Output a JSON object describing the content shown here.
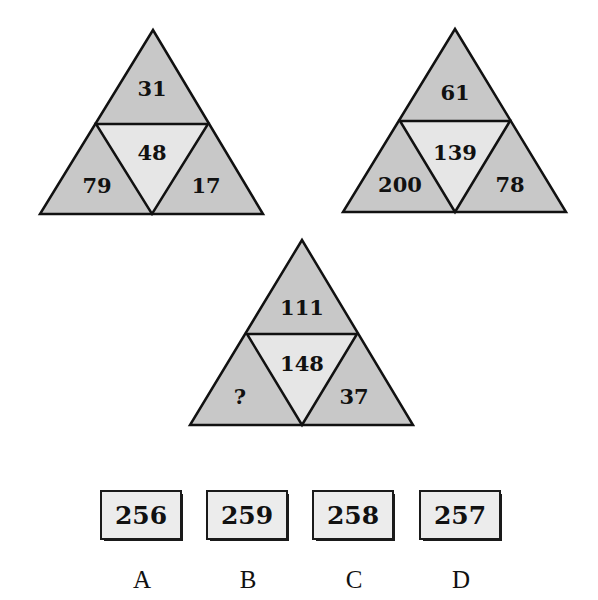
{
  "colors": {
    "outer_fill": "#c8c8c8",
    "center_fill": "#e6e6e6",
    "stroke": "#111111",
    "option_fill": "#ececec"
  },
  "triangles": [
    {
      "top": "31",
      "center": "48",
      "left": "79",
      "right": "17"
    },
    {
      "top": "61",
      "center": "139",
      "left": "200",
      "right": "78"
    },
    {
      "top": "111",
      "center": "148",
      "left": "?",
      "right": "37"
    }
  ],
  "options": [
    {
      "letter": "A",
      "value": "256"
    },
    {
      "letter": "B",
      "value": "259"
    },
    {
      "letter": "C",
      "value": "258"
    },
    {
      "letter": "D",
      "value": "257"
    }
  ]
}
